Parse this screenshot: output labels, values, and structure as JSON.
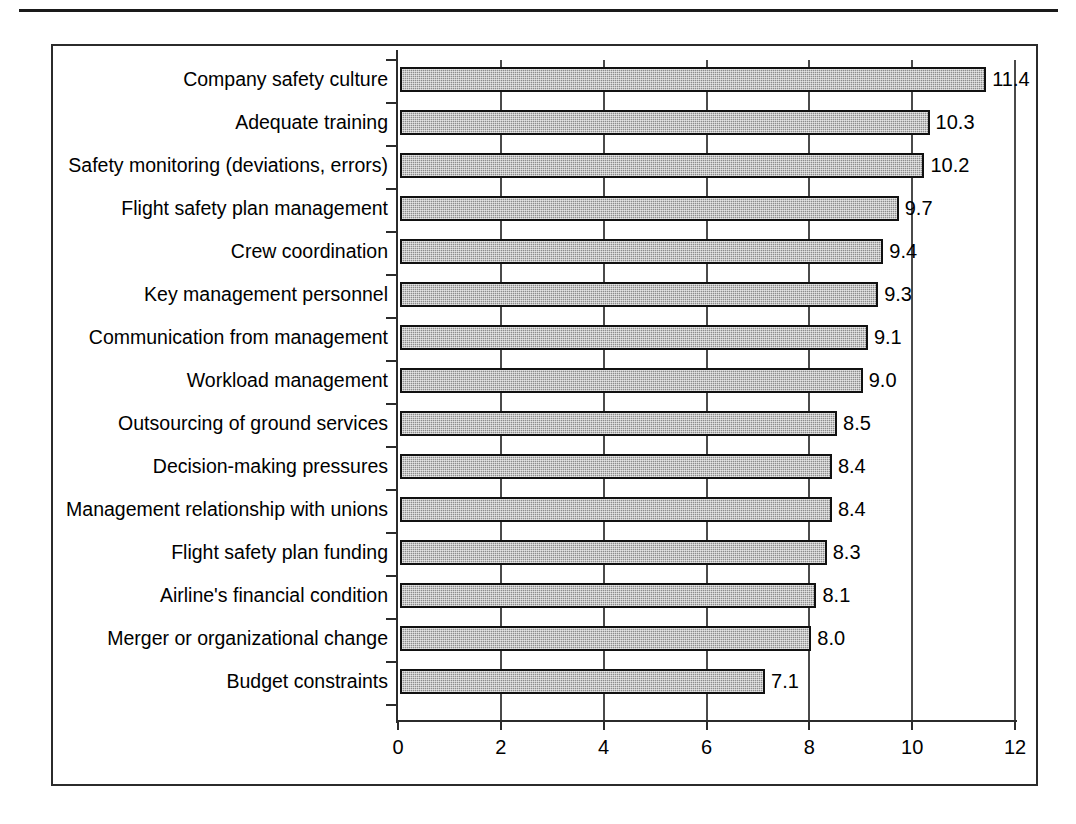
{
  "page": {
    "rule": "horizontal-rule"
  },
  "chart_data": {
    "type": "bar",
    "orientation": "horizontal",
    "title": "",
    "subtitle": "",
    "xlabel": "",
    "ylabel": "",
    "xlim": [
      0,
      12
    ],
    "xticks": [
      "0",
      "2",
      "4",
      "6",
      "8",
      "10",
      "12"
    ],
    "xtick_values": [
      0,
      2,
      4,
      6,
      8,
      10,
      12
    ],
    "grid": "vertical",
    "legend": "none",
    "bar_color": "#8d8d8d",
    "bar_border_color": "#111111",
    "categories": [
      "Company safety culture",
      "Adequate training",
      "Safety monitoring (deviations, errors)",
      "Flight safety plan management",
      "Crew coordination",
      "Key management personnel",
      "Communication from management",
      "Workload management",
      "Outsourcing of ground services",
      "Decision-making pressures",
      "Management relationship with unions",
      "Flight safety plan funding",
      "Airline's financial condition",
      "Merger or organizational change",
      "Budget constraints"
    ],
    "values": [
      11.4,
      10.3,
      10.2,
      9.7,
      9.4,
      9.3,
      9.1,
      9.0,
      8.5,
      8.4,
      8.4,
      8.3,
      8.1,
      8.0,
      7.1
    ],
    "value_labels": [
      "11.4",
      "10.3",
      "10.2",
      "9.7",
      "9.4",
      "9.3",
      "9.1",
      "9.0",
      "8.5",
      "8.4",
      "8.4",
      "8.3",
      "8.1",
      "8.0",
      "7.1"
    ]
  }
}
